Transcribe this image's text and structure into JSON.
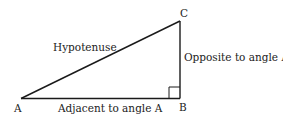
{
  "diagram": {
    "type": "right-triangle",
    "vertices": {
      "A": "A",
      "B": "B",
      "C": "C"
    },
    "labels": {
      "hypotenuse": "Hypotenuse",
      "opposite": "Opposite to angle A",
      "adjacent": "Adjacent to angle A"
    },
    "right_angle_at": "B",
    "stroke_color": "#1a1a1a"
  }
}
